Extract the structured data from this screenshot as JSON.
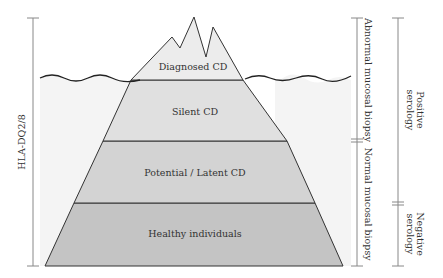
{
  "diagram": {
    "type": "iceberg",
    "layers": [
      {
        "label": "Diagnosed CD",
        "position": "above-water",
        "fill": "#ececec"
      },
      {
        "label": "Silent CD",
        "position": "below-water",
        "fill": "#e0e0e0"
      },
      {
        "label": "Potential / Latent CD",
        "position": "below-water",
        "fill": "#d3d3d3"
      },
      {
        "label": "Healthy individuals",
        "position": "below-water",
        "fill": "#c4c4c4"
      }
    ],
    "left_bracket": {
      "label": "HLA-DQ2/8",
      "spans": [
        "Diagnosed CD",
        "Silent CD",
        "Potential / Latent CD",
        "Healthy individuals"
      ]
    },
    "biopsy_bracket": {
      "segments": [
        {
          "label": "Abnormal mucosal biopsy",
          "spans": [
            "Diagnosed CD",
            "Silent CD"
          ]
        },
        {
          "label": "Normal mucosal biopsy",
          "spans": [
            "Potential / Latent CD",
            "Healthy individuals"
          ]
        }
      ]
    },
    "serology_bracket": {
      "segments": [
        {
          "label_line1": "Positive",
          "label_line2": "serology",
          "spans": [
            "Diagnosed CD",
            "Silent CD",
            "Potential / Latent CD"
          ]
        },
        {
          "label_line1": "Negative",
          "label_line2": "serology",
          "spans": [
            "Healthy individuals"
          ]
        }
      ]
    },
    "colors": {
      "water": "#f2f2f2",
      "outline": "#333333",
      "bracket": "#888888"
    }
  }
}
